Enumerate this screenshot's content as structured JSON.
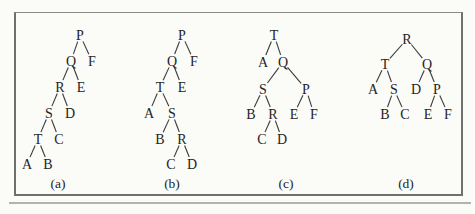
{
  "figure": {
    "background": "#fbfbf8",
    "frame_border_color": "#6f6f6f",
    "shadow_color": "#b2b2b2",
    "text_color": "#242424",
    "line_color": "#3a3a3a"
  },
  "trees": [
    {
      "id": "a",
      "caption": "(a)",
      "caption_x": 58,
      "caption_y": 183,
      "nodes": [
        {
          "label": "P",
          "x": 80,
          "y": 35
        },
        {
          "label": "Q",
          "x": 71,
          "y": 61
        },
        {
          "label": "F",
          "x": 92,
          "y": 61
        },
        {
          "label": "R",
          "x": 60,
          "y": 87
        },
        {
          "label": "E",
          "x": 81,
          "y": 87
        },
        {
          "label": "S",
          "x": 49,
          "y": 113
        },
        {
          "label": "D",
          "x": 70,
          "y": 113
        },
        {
          "label": "T",
          "x": 38,
          "y": 139
        },
        {
          "label": "C",
          "x": 59,
          "y": 139
        },
        {
          "label": "A",
          "x": 27,
          "y": 164
        },
        {
          "label": "B",
          "x": 48,
          "y": 164
        }
      ],
      "edges": [
        [
          "P",
          "Q"
        ],
        [
          "P",
          "F"
        ],
        [
          "Q",
          "R"
        ],
        [
          "Q",
          "E"
        ],
        [
          "R",
          "S"
        ],
        [
          "R",
          "D"
        ],
        [
          "S",
          "T"
        ],
        [
          "S",
          "C"
        ],
        [
          "T",
          "A"
        ],
        [
          "T",
          "B"
        ]
      ]
    },
    {
      "id": "b",
      "caption": "(b)",
      "caption_x": 172,
      "caption_y": 183,
      "nodes": [
        {
          "label": "P",
          "x": 182,
          "y": 35
        },
        {
          "label": "Q",
          "x": 172,
          "y": 61
        },
        {
          "label": "F",
          "x": 194,
          "y": 61
        },
        {
          "label": "T",
          "x": 160,
          "y": 87
        },
        {
          "label": "E",
          "x": 182,
          "y": 87
        },
        {
          "label": "A",
          "x": 149,
          "y": 113
        },
        {
          "label": "S",
          "x": 172,
          "y": 113
        },
        {
          "label": "B",
          "x": 160,
          "y": 139
        },
        {
          "label": "R",
          "x": 182,
          "y": 139
        },
        {
          "label": "C",
          "x": 171,
          "y": 164
        },
        {
          "label": "D",
          "x": 192,
          "y": 164
        }
      ],
      "edges": [
        [
          "P",
          "Q"
        ],
        [
          "P",
          "F"
        ],
        [
          "Q",
          "T"
        ],
        [
          "Q",
          "E"
        ],
        [
          "T",
          "A"
        ],
        [
          "T",
          "S"
        ],
        [
          "S",
          "B"
        ],
        [
          "S",
          "R"
        ],
        [
          "R",
          "C"
        ],
        [
          "R",
          "D"
        ]
      ]
    },
    {
      "id": "c",
      "caption": "(c)",
      "caption_x": 286,
      "caption_y": 183,
      "nodes": [
        {
          "label": "T",
          "x": 274,
          "y": 35
        },
        {
          "label": "A",
          "x": 263,
          "y": 62
        },
        {
          "label": "Q",
          "x": 283,
          "y": 62
        },
        {
          "label": "S",
          "x": 263,
          "y": 89
        },
        {
          "label": "P",
          "x": 306,
          "y": 89
        },
        {
          "label": "B",
          "x": 251,
          "y": 114
        },
        {
          "label": "R",
          "x": 273,
          "y": 114
        },
        {
          "label": "E",
          "x": 294,
          "y": 114
        },
        {
          "label": "F",
          "x": 314,
          "y": 114
        },
        {
          "label": "C",
          "x": 262,
          "y": 139
        },
        {
          "label": "D",
          "x": 282,
          "y": 139
        }
      ],
      "edges": [
        [
          "T",
          "A"
        ],
        [
          "T",
          "Q"
        ],
        [
          "Q",
          "S"
        ],
        [
          "Q",
          "P"
        ],
        [
          "S",
          "B"
        ],
        [
          "S",
          "R"
        ],
        [
          "R",
          "C"
        ],
        [
          "R",
          "D"
        ],
        [
          "P",
          "E"
        ],
        [
          "P",
          "F"
        ]
      ]
    },
    {
      "id": "d",
      "caption": "(d)",
      "caption_x": 406,
      "caption_y": 183,
      "nodes": [
        {
          "label": "R",
          "x": 407,
          "y": 39
        },
        {
          "label": "T",
          "x": 385,
          "y": 64
        },
        {
          "label": "Q",
          "x": 427,
          "y": 64
        },
        {
          "label": "A",
          "x": 373,
          "y": 89
        },
        {
          "label": "S",
          "x": 394,
          "y": 89
        },
        {
          "label": "D",
          "x": 416,
          "y": 89
        },
        {
          "label": "P",
          "x": 437,
          "y": 89
        },
        {
          "label": "B",
          "x": 385,
          "y": 114
        },
        {
          "label": "C",
          "x": 405,
          "y": 114
        },
        {
          "label": "E",
          "x": 428,
          "y": 114
        },
        {
          "label": "F",
          "x": 448,
          "y": 114
        }
      ],
      "edges": [
        [
          "R",
          "T"
        ],
        [
          "R",
          "Q"
        ],
        [
          "T",
          "A"
        ],
        [
          "T",
          "S"
        ],
        [
          "S",
          "B"
        ],
        [
          "S",
          "C"
        ],
        [
          "Q",
          "D"
        ],
        [
          "Q",
          "P"
        ],
        [
          "P",
          "E"
        ],
        [
          "P",
          "F"
        ]
      ]
    }
  ]
}
